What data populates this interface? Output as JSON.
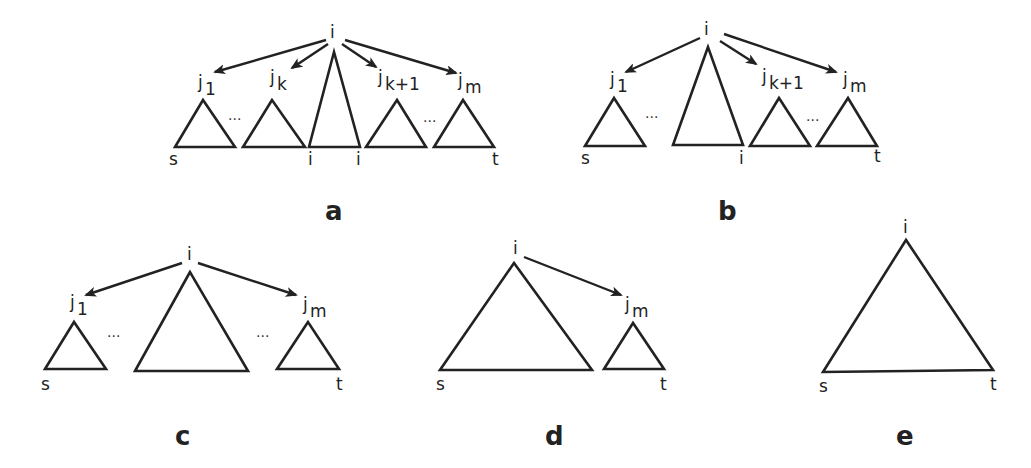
{
  "figure": {
    "panels": [
      {
        "id": "a",
        "letter": "a",
        "root": "i",
        "children": [
          {
            "base": "j",
            "sub": "1"
          },
          {
            "base": "j",
            "sub": "k"
          },
          {
            "base": "j",
            "sub": "k+1"
          },
          {
            "base": "j",
            "sub": "m"
          }
        ],
        "ellipsis": "...",
        "bottom_labels": {
          "left": "s",
          "mid_left": "i",
          "mid_right": "i",
          "right": "t"
        }
      },
      {
        "id": "b",
        "letter": "b",
        "root": "i",
        "children": [
          {
            "base": "j",
            "sub": "1"
          },
          {
            "base": "j",
            "sub": "k+1"
          },
          {
            "base": "j",
            "sub": "m"
          }
        ],
        "ellipsis": "...",
        "bottom_labels": {
          "left": "s",
          "mid": "i",
          "right": "t"
        }
      },
      {
        "id": "c",
        "letter": "c",
        "root": "i",
        "children": [
          {
            "base": "j",
            "sub": "1"
          },
          {
            "base": "j",
            "sub": "m"
          }
        ],
        "ellipsis": "...",
        "bottom_labels": {
          "left": "s",
          "right": "t"
        }
      },
      {
        "id": "d",
        "letter": "d",
        "root": "i",
        "children": [
          {
            "base": "j",
            "sub": "m"
          }
        ],
        "bottom_labels": {
          "left": "s",
          "right": "t"
        }
      },
      {
        "id": "e",
        "letter": "e",
        "root": "i",
        "children": [],
        "bottom_labels": {
          "left": "s",
          "right": "t"
        }
      }
    ]
  }
}
